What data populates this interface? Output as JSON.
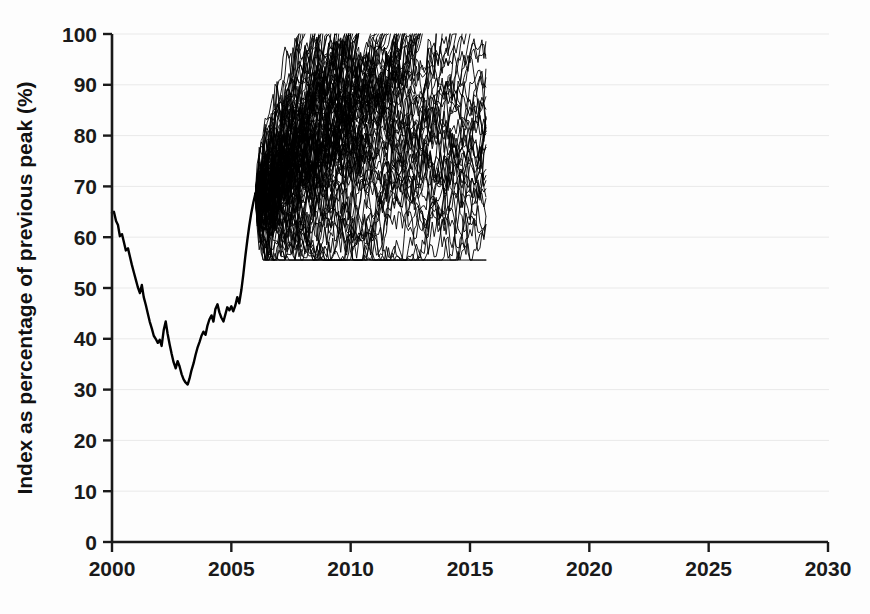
{
  "chart_data": {
    "type": "line",
    "title": "",
    "subtitle": "",
    "xlabel": "",
    "ylabel": "Index as percentage of previous peak (%)",
    "xlim": [
      2000,
      2030
    ],
    "ylim": [
      0,
      100
    ],
    "xticks": [
      2000,
      2005,
      2010,
      2015,
      2020,
      2025,
      2030
    ],
    "xtick_labels": [
      "2000",
      "2005",
      "2010",
      "2015",
      "2020",
      "2025",
      "2030"
    ],
    "yticks": [
      0,
      10,
      20,
      30,
      40,
      50,
      60,
      70,
      80,
      90,
      100
    ],
    "ytick_labels": [
      "0",
      "10",
      "20",
      "30",
      "40",
      "50",
      "60",
      "70",
      "80",
      "90",
      "100"
    ],
    "grid": true,
    "grid_axis": "y",
    "grid_color": "#e9e9e9",
    "legend": false,
    "legend_position": "none",
    "line_color": "#000000",
    "background_color": "#fdfdfd",
    "axis_color": "#1a1a1a",
    "annotations": [],
    "series": [
      {
        "name": "Historical index",
        "kind": "history",
        "line_width": 2.4,
        "color": "#000000",
        "x": [
          2000.0,
          2000.08,
          2000.17,
          2000.25,
          2000.33,
          2000.42,
          2000.5,
          2000.58,
          2000.67,
          2000.75,
          2000.83,
          2000.92,
          2001.0,
          2001.08,
          2001.17,
          2001.25,
          2001.33,
          2001.42,
          2001.5,
          2001.58,
          2001.67,
          2001.75,
          2001.83,
          2001.92,
          2002.0,
          2002.08,
          2002.17,
          2002.25,
          2002.33,
          2002.42,
          2002.5,
          2002.58,
          2002.67,
          2002.75,
          2002.83,
          2002.92,
          2003.0,
          2003.08,
          2003.17,
          2003.25,
          2003.33,
          2003.42,
          2003.5,
          2003.58,
          2003.67,
          2003.75,
          2003.83,
          2003.92,
          2004.0,
          2004.08,
          2004.17,
          2004.25,
          2004.33,
          2004.42,
          2004.5,
          2004.58,
          2004.67,
          2004.75,
          2004.83,
          2004.92,
          2005.0,
          2005.08,
          2005.17,
          2005.25,
          2005.33,
          2005.42,
          2005.5,
          2005.58,
          2005.67,
          2005.75,
          2005.83,
          2005.92,
          2006.0
        ],
        "y": [
          64.8,
          65.0,
          63.2,
          62.4,
          60.2,
          60.6,
          59.0,
          57.4,
          57.8,
          56.2,
          54.6,
          53.0,
          51.6,
          50.2,
          49.0,
          50.6,
          48.2,
          46.6,
          45.0,
          43.4,
          42.0,
          40.6,
          40.0,
          39.2,
          39.8,
          38.6,
          41.8,
          43.4,
          41.0,
          38.8,
          37.0,
          35.4,
          34.2,
          35.6,
          34.6,
          33.0,
          32.0,
          31.4,
          31.0,
          32.2,
          33.8,
          35.2,
          36.8,
          38.2,
          39.4,
          40.6,
          41.4,
          40.8,
          42.6,
          43.8,
          44.6,
          43.4,
          45.8,
          46.8,
          45.2,
          44.2,
          43.4,
          44.8,
          46.2,
          45.6,
          46.4,
          45.4,
          46.6,
          48.2,
          47.0,
          49.6,
          52.6,
          56.0,
          59.4,
          62.2,
          64.6,
          66.8,
          68.4
        ]
      },
      {
        "name": "Stochastic simulation paths (projection fan)",
        "kind": "projection-fan",
        "line_width": 0.9,
        "color": "#000000",
        "n_paths": 120,
        "start_x": 2006.0,
        "start_y": 68.4,
        "cap_y": 100,
        "drift_per_year": 4.6,
        "drift_spread": 2.9,
        "volatility": 2.35,
        "first_cap_x": 2011.2,
        "last_cap_x": 2014.4,
        "min_excursion_y": 57.5,
        "description": "Fan of simulated future index paths rising from the 2006 level and terminating when each path reaches 100% of previous peak."
      }
    ]
  },
  "axes": {
    "y_title": "Index as percentage of previous peak (%)"
  }
}
